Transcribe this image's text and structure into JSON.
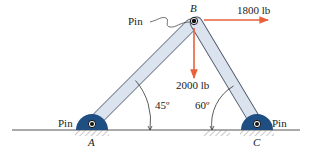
{
  "diagram": {
    "type": "truss-frame",
    "colors": {
      "member_fill": "#dbe3ee",
      "member_stroke": "#4a5668",
      "support_fill": "#1f4e82",
      "force_arrow": "#e8603c",
      "ground": "#555555",
      "text": "#222222"
    },
    "joints": {
      "A": {
        "label": "A",
        "type": "Pin"
      },
      "B": {
        "label": "B",
        "type": "Pin"
      },
      "C": {
        "label": "C",
        "type": "Pin"
      }
    },
    "pin_labels": {
      "top": "Pin",
      "left": "Pin",
      "right": "Pin"
    },
    "forces": [
      {
        "id": "horizontal",
        "label": "1800 lb",
        "direction": "right",
        "at": "B"
      },
      {
        "id": "vertical",
        "label": "2000 lb",
        "direction": "down",
        "at": "B"
      }
    ],
    "angles": [
      {
        "id": "angle-a",
        "label": "45º",
        "at": "A"
      },
      {
        "id": "angle-c",
        "label": "60º",
        "at": "C"
      }
    ]
  }
}
